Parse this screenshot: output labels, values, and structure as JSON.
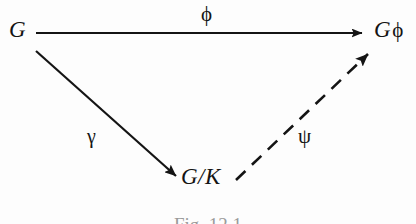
{
  "figure": {
    "type": "commutative-diagram",
    "caption": "Fig. 12.1",
    "background_color": "#fdfdfd",
    "ink_color": "#141414"
  },
  "nodes": [
    {
      "id": "G",
      "label": "G",
      "position": "top-left"
    },
    {
      "id": "Gphi",
      "label_base": "G",
      "label_modifier": "ϕ",
      "label": "Gϕ",
      "position": "top-right"
    },
    {
      "id": "GK",
      "label": "G/K",
      "position": "bottom-center"
    }
  ],
  "arrows": [
    {
      "id": "phi",
      "label": "ϕ",
      "from": "G",
      "to": "Gphi",
      "style": "solid",
      "label_position": "above"
    },
    {
      "id": "gamma",
      "label": "γ",
      "from": "G",
      "to": "GK",
      "style": "solid",
      "label_position": "left"
    },
    {
      "id": "psi",
      "label": "ψ",
      "from": "GK",
      "to": "Gphi",
      "style": "dashed",
      "label_position": "right"
    }
  ]
}
